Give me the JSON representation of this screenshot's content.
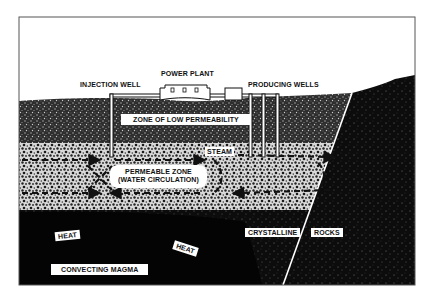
{
  "diagram": {
    "type": "geothermal cross-section",
    "surface_labels": {
      "injection_well": "INJECTION WELL",
      "power_plant": "POWER PLANT",
      "producing_wells": "PRODUCING WELLS"
    },
    "layer_labels": {
      "low_permeability": "ZONE OF LOW PERMEABILITY",
      "steam": "STEAM",
      "permeable_zone_line1": "PERMEABLE ZONE",
      "permeable_zone_line2": "(WATER CIRCULATION)",
      "heat_1": "HEAT",
      "heat_2": "HEAT",
      "crystalline": "CRYSTALLINE",
      "rocks": "ROCKS",
      "convecting_magma": "CONVECTING MAGMA"
    },
    "colors": {
      "sky": "#ffffff",
      "frame": "#555555",
      "low_perm_layer": "#2a2a2a",
      "permeable_layer": "#9a9a9a",
      "magma": "#050505",
      "crystalline_rock": "#151515",
      "label_bg": "#ffffff",
      "label_text": "#111111"
    }
  }
}
